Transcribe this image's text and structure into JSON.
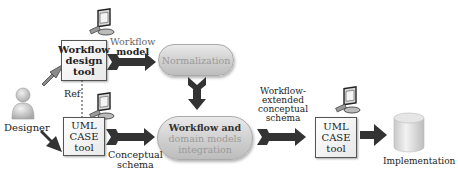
{
  "actor": {
    "label": "Designer",
    "icon": "person-icon"
  },
  "tools": {
    "workflow_design_tool": [
      "Workflow",
      "design",
      "tool"
    ],
    "uml_case_tool_1": [
      "UML",
      "CASE",
      "tool"
    ],
    "uml_case_tool_2": [
      "UML",
      "CASE",
      "tool"
    ]
  },
  "processes": {
    "normalization": "Normalization",
    "integration": [
      "Workflow and",
      "domain models",
      "integration"
    ]
  },
  "edge_labels": {
    "workflow_model": [
      "Workflow",
      "model"
    ],
    "ref": "Ref",
    "conceptual_schema": [
      "Conceptual",
      "schema"
    ],
    "workflow_extended": [
      "Workflow-",
      "extended",
      "conceptual",
      "schema"
    ]
  },
  "output": {
    "label": "Implementation",
    "icon": "database-cylinder-icon"
  },
  "colors": {
    "arrow": "#3a3a3a",
    "box_border": "#555555",
    "pill_fill": "#cfcfcf",
    "cylinder_fill": "#dcdcdc"
  }
}
